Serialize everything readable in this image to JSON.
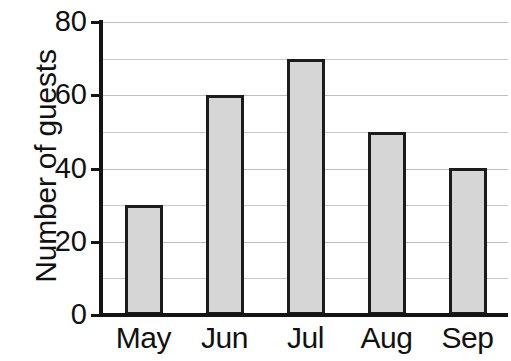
{
  "chart_data": {
    "type": "bar",
    "title": "",
    "subtitle": "",
    "xlabel": "",
    "ylabel": "Number of guests",
    "categories": [
      "May",
      "Jun",
      "Jul",
      "Aug",
      "Sep"
    ],
    "values": [
      30,
      60,
      70,
      50,
      40
    ],
    "ylim": [
      0,
      80
    ],
    "y_major_ticks": [
      0,
      20,
      40,
      60,
      80
    ],
    "y_gridlines": [
      10,
      20,
      30,
      40,
      50,
      60,
      70,
      80
    ],
    "y_tick_labels": [
      "0",
      "20",
      "40",
      "60",
      "80"
    ],
    "grid": true,
    "legend": false,
    "legend_position": "none",
    "orientation": "vertical",
    "colors": {
      "bar_fill": "#d6d6d6",
      "bar_border": "#1c1c1c",
      "gridline": "#c8c8c8",
      "axis": "#141414",
      "text": "#111111",
      "background": "#ffffff"
    }
  }
}
